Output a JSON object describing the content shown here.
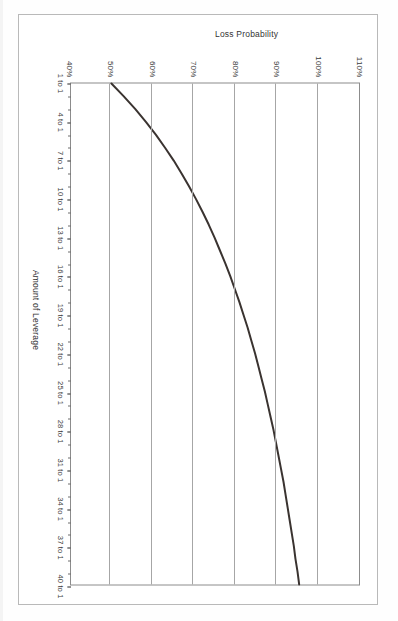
{
  "document": {
    "kind": "scanned-figure-page",
    "orientation": "rotated-90-clockwise",
    "frame_color": "#b9b9b9",
    "background_color": "#ffffff"
  },
  "chart_data": {
    "type": "line",
    "title": "",
    "xlabel": "Amount of Leverage",
    "ylabel": "Loss Probability",
    "grid": true,
    "legend": "none",
    "line_color": "#3a3330",
    "axis_color": "#8c8c8c",
    "gridline_color": "#a6a6a6",
    "xlim": [
      1,
      40
    ],
    "ylim": [
      40,
      110
    ],
    "y_tick_labels": [
      "110%",
      "100%",
      "90%",
      "80%",
      "70%",
      "60%",
      "50%",
      "40%"
    ],
    "y_tick_values": [
      110,
      100,
      90,
      80,
      70,
      60,
      50,
      40
    ],
    "x_tick_labels": [
      "1 to 1",
      "4 to 1",
      "7 to 1",
      "10 to 1",
      "13 to 1",
      "16 to 1",
      "19 to 1",
      "22 to 1",
      "25 to 1",
      "28 to 1",
      "31 to 1",
      "34 to 1",
      "37 to 1",
      "40 to 1"
    ],
    "x_tick_values": [
      1,
      4,
      7,
      10,
      13,
      16,
      19,
      22,
      25,
      28,
      31,
      34,
      37,
      40
    ],
    "x_minor_tick_step": 1,
    "x": [
      1,
      2,
      3,
      4,
      5,
      6,
      7,
      8,
      9,
      10,
      11,
      12,
      13,
      14,
      15,
      16,
      17,
      18,
      19,
      20,
      21,
      22,
      23,
      24,
      25,
      26,
      27,
      28,
      29,
      30,
      31,
      32,
      33,
      34,
      35,
      36,
      37,
      38,
      39,
      40
    ],
    "y": [
      50.0,
      53.0,
      55.8,
      58.4,
      60.8,
      63.0,
      65.1,
      67.0,
      68.8,
      70.5,
      72.1,
      73.6,
      75.0,
      76.3,
      77.6,
      78.8,
      79.9,
      81.0,
      82.0,
      83.0,
      83.9,
      84.8,
      85.6,
      86.4,
      87.2,
      87.9,
      88.6,
      89.3,
      89.9,
      90.5,
      91.1,
      91.7,
      92.2,
      92.7,
      93.2,
      93.7,
      94.2,
      94.6,
      95.1,
      95.5
    ],
    "series_note": "Loss probability rises steeply from 50% at 1-to-1 leverage and asymptotes toward 100% at high leverage"
  }
}
